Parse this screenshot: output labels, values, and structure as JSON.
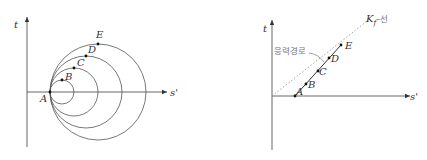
{
  "left_diagram": {
    "axis_labels": {
      "y": "t",
      "x": "s'"
    },
    "origin_point": "A",
    "points": [
      {
        "label": "A"
      },
      {
        "label": "B"
      },
      {
        "label": "C"
      },
      {
        "label": "D"
      },
      {
        "label": "E"
      }
    ],
    "circles": [
      {
        "through": [
          "A",
          "B"
        ]
      },
      {
        "through": [
          "A",
          "C"
        ]
      },
      {
        "through": [
          "A",
          "D"
        ]
      },
      {
        "through": [
          "A",
          "E"
        ]
      }
    ]
  },
  "right_diagram": {
    "axis_labels": {
      "y": "t",
      "x": "s'"
    },
    "points": [
      {
        "label": "A"
      },
      {
        "label": "B"
      },
      {
        "label": "C"
      },
      {
        "label": "D"
      },
      {
        "label": "E"
      }
    ],
    "stress_path_label": "응력경로",
    "kf_line_label": {
      "symbol": "K",
      "subscript": "f",
      "suffix": "–선"
    }
  }
}
